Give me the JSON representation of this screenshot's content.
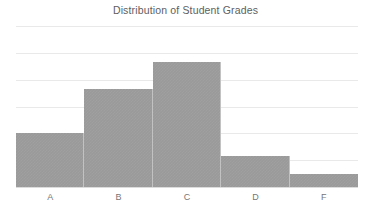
{
  "chart_data": {
    "type": "bar",
    "title": "Distribution of Student Grades",
    "xlabel": "",
    "ylabel": "",
    "categories": [
      "A",
      "B",
      "C",
      "D",
      "F"
    ],
    "values": [
      12,
      22,
      28,
      7,
      3
    ],
    "series": [
      {
        "name": "Number of Students",
        "values": [
          12,
          22,
          28,
          7,
          3
        ]
      }
    ],
    "ylim": [
      0,
      36
    ],
    "yticks": [
      0,
      6,
      12,
      18,
      24,
      30,
      36
    ],
    "grid": true,
    "grid_axis": "y",
    "legend": false,
    "legend_position": "none",
    "bar_style": "histogram-contiguous",
    "bar_color": "#9a9a9a",
    "bar_edge_color": "#c2c2c2",
    "gridline_color": "#e9e9e9",
    "axis_color": "#dcdcdc",
    "title_color": "#5e5e5e",
    "tick_label_color": "#767676",
    "background_color": "#ffffff",
    "annotations": []
  },
  "axis": {
    "x_tick_labels": [
      "A",
      "B",
      "C",
      "D",
      "F"
    ]
  }
}
